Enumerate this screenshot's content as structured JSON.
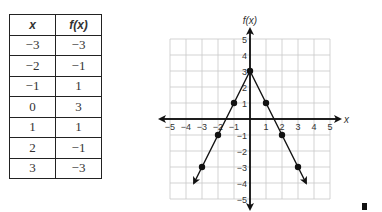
{
  "table": {
    "headers": [
      "x",
      "f(x)"
    ],
    "rows": [
      [
        "−3",
        "−3"
      ],
      [
        "−2",
        "−1"
      ],
      [
        "−1",
        "1"
      ],
      [
        "0",
        "3"
      ],
      [
        "1",
        "1"
      ],
      [
        "2",
        "−1"
      ],
      [
        "3",
        "−3"
      ]
    ]
  },
  "chart_data": {
    "type": "line",
    "title": "",
    "xlabel": "x",
    "ylabel": "f(x)",
    "xlim": [
      -5,
      5
    ],
    "ylim": [
      -5,
      5
    ],
    "grid": true,
    "x_ticks": [
      "−5",
      "−4",
      "−3",
      "−2",
      "−1",
      "1",
      "2",
      "3",
      "4",
      "5"
    ],
    "y_ticks": [
      "5",
      "4",
      "3",
      "2",
      "1",
      "−1",
      "−2",
      "−3",
      "−4",
      "−5"
    ],
    "series": [
      {
        "name": "f(x)",
        "x": [
          -3,
          -2,
          -1,
          0,
          1,
          2,
          3
        ],
        "y": [
          -3,
          -1,
          1,
          3,
          1,
          -1,
          -3
        ]
      }
    ]
  }
}
